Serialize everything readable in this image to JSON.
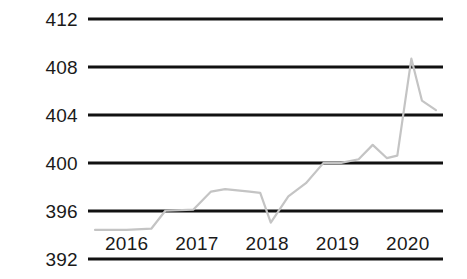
{
  "chart_data": {
    "type": "line",
    "title": "",
    "subtitle": "",
    "xlabel": "",
    "ylabel": "",
    "xlim": [
      2015.45,
      2020.5
    ],
    "ylim": [
      390.3,
      413.6
    ],
    "grid": true,
    "legend": null,
    "yticks": [
      412,
      408,
      404,
      400,
      396,
      392
    ],
    "ytick_labels": [
      "412",
      "408",
      "404",
      "400",
      "396",
      "392"
    ],
    "xticks": [
      2016,
      2017,
      2018,
      2019,
      2020
    ],
    "xtick_labels": [
      "2016",
      "2017",
      "2018",
      "2019",
      "2020"
    ],
    "series": [
      {
        "name": "value",
        "color": "#c4c4c4",
        "x": [
          2015.55,
          2016.0,
          2016.35,
          2016.55,
          2016.95,
          2017.2,
          2017.4,
          2017.75,
          2017.9,
          2018.05,
          2018.3,
          2018.55,
          2018.8,
          2019.05,
          2019.3,
          2019.5,
          2019.7,
          2019.85,
          2020.05,
          2020.2,
          2020.4
        ],
        "values": [
          394.4,
          394.4,
          394.5,
          396.0,
          396.1,
          397.6,
          397.8,
          397.6,
          397.5,
          395.0,
          397.2,
          398.3,
          400.0,
          400.0,
          400.3,
          401.5,
          400.4,
          400.6,
          408.7,
          405.2,
          404.4
        ]
      }
    ]
  },
  "axes": {
    "y_label_color": "#1a1a1a",
    "x_label_color": "#1a1a1a",
    "gridline_color": "#111111",
    "background": "#ffffff"
  }
}
